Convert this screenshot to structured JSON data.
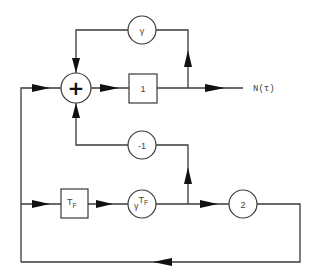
{
  "diagram": {
    "type": "signal-flow block diagram",
    "nodes": {
      "sum": {
        "symbol": "+",
        "shape": "circle"
      },
      "gain_one": {
        "label": "1",
        "shape": "box"
      },
      "gamma": {
        "label": "γ",
        "shape": "circle"
      },
      "neg_one": {
        "label": "-1",
        "shape": "circle"
      },
      "delay": {
        "label": "T",
        "subscript": "F",
        "shape": "box"
      },
      "gamma_tf": {
        "base": "γ",
        "exponent": "T",
        "exponent_sub": "F",
        "shape": "circle"
      },
      "two": {
        "label": "2",
        "shape": "circle"
      }
    },
    "output": {
      "label": "N(τ)"
    },
    "connections": [
      "sum -> gain_one",
      "gain_one -> N(τ)",
      "gain_one output -> gamma -> sum (top feedback)",
      "gain_one output -> neg_one -> sum (bottom feedback)",
      "left bus -> sum",
      "left bus -> delay -> gamma_tf",
      "gamma_tf output -> neg_one",
      "gamma_tf output -> two -> bottom return -> left bus"
    ]
  }
}
